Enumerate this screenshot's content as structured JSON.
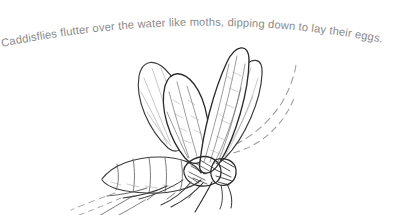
{
  "page": {
    "background_color": "#ffffff",
    "width": 403,
    "height": 215
  },
  "caption": {
    "text": "Caddisflies flutter over the water like moths, dipping down to lay their eggs.",
    "color": "#8a8a8a",
    "style": "curved-arc"
  },
  "illustration": {
    "subject": "caddisfly",
    "medium": "pencil sketch",
    "ink_color": "#3c3c3c",
    "parts": {
      "wings": "four raised wings with vein hatching",
      "antennae": "two long dashed antennae sweeping up-right",
      "abdomen": "segmented abdomen angled down-left",
      "legs": "six legs trailing down-left"
    }
  }
}
